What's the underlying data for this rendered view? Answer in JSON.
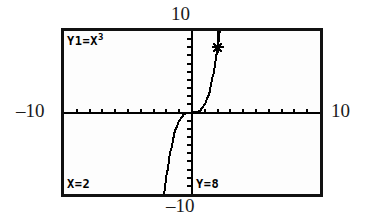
{
  "screen": {
    "device": "graphing-calculator",
    "equation_label": "Y1=X",
    "equation_exponent": "3",
    "x_readout": "X=2",
    "y_readout": "Y=8"
  },
  "axis_labels": {
    "top": "10",
    "left": "–10",
    "right": "10",
    "bottom": "–10"
  },
  "colors": {
    "ink": "#000000",
    "frame": "#111111",
    "screen_background": "#fdfdfd",
    "page_background": "#ffffff"
  },
  "chart_data": {
    "type": "line",
    "xlabel": "",
    "ylabel": "",
    "xlim": [
      -10,
      10
    ],
    "ylim": [
      -10,
      10
    ],
    "grid": false,
    "axis_ticks": {
      "x_step": 1,
      "y_step": 1,
      "x_tick_values": [
        -9,
        -8,
        -7,
        -6,
        -5,
        -4,
        -3,
        -2,
        -1,
        1,
        2,
        3,
        4,
        5,
        6,
        7,
        8,
        9
      ],
      "y_tick_values": [
        -9,
        -8,
        -7,
        -6,
        -5,
        -4,
        -3,
        -2,
        -1,
        1,
        2,
        3,
        4,
        5,
        6,
        7,
        8,
        9
      ]
    },
    "series": [
      {
        "name": "Y1=X³",
        "expression": "y = x^3",
        "x": [
          -2.16,
          -2.1,
          -2.0,
          -1.9,
          -1.8,
          -1.7,
          -1.6,
          -1.5,
          -1.4,
          -1.3,
          -1.2,
          -1.1,
          -1.0,
          -0.8,
          -0.6,
          -0.4,
          -0.2,
          0.0,
          0.2,
          0.4,
          0.6,
          0.8,
          1.0,
          1.1,
          1.2,
          1.3,
          1.4,
          1.5,
          1.6,
          1.7,
          1.8,
          1.9,
          2.0,
          2.1,
          2.16
        ],
        "y": [
          -10.08,
          -9.26,
          -8.0,
          -6.86,
          -5.83,
          -4.91,
          -4.1,
          -3.38,
          -2.74,
          -2.2,
          -1.73,
          -1.33,
          -1.0,
          -0.51,
          -0.22,
          -0.06,
          -0.01,
          0.0,
          0.01,
          0.06,
          0.22,
          0.51,
          1.0,
          1.33,
          1.73,
          2.2,
          2.74,
          3.38,
          4.1,
          4.91,
          5.83,
          6.86,
          8.0,
          9.26,
          10.08
        ]
      }
    ],
    "annotations": [
      {
        "kind": "trace-cursor",
        "label": "X=2  Y=8",
        "x": 2,
        "y": 8
      },
      {
        "kind": "vertical-trace-line",
        "x": 2,
        "y_from": 8,
        "y_to": 10
      }
    ]
  }
}
